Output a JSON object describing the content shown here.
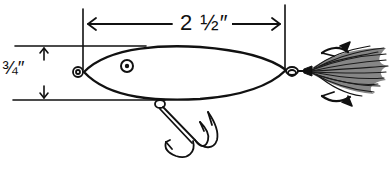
{
  "figure": {
    "line_color": "#111111",
    "background": "#ffffff",
    "dimensions": {
      "length": {
        "label": "2 ½″",
        "value": "2 1/2 in"
      },
      "height": {
        "label": "¾″",
        "value": "3/4 in"
      }
    },
    "parts": [
      "body",
      "eye",
      "line-tie-eyelet",
      "belly-treble-hook",
      "tail-eyelet",
      "dressed-tail-treble-hook"
    ]
  }
}
